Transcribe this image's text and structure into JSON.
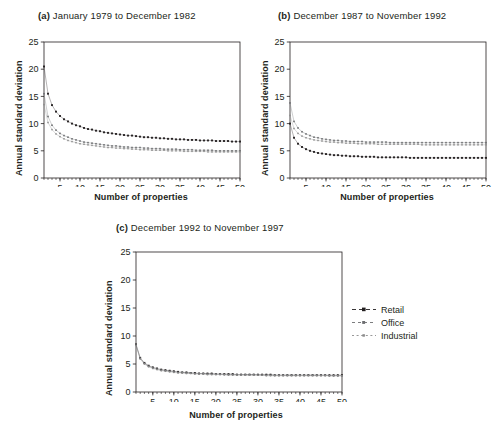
{
  "figure": {
    "y_axis_label": "Annual standard deviation",
    "x_axis_label": "Number of properties",
    "y_ticks": [
      0,
      5,
      10,
      15,
      20,
      25
    ],
    "x_ticks": [
      5,
      10,
      15,
      20,
      25,
      30,
      35,
      40,
      45,
      50
    ],
    "colors": {
      "retail": "#231f20",
      "office": "#6d6e71",
      "industrial": "#8c8c8c",
      "axis": "#231f20"
    }
  },
  "legend": {
    "items": [
      {
        "label": "Retail",
        "key": "retail"
      },
      {
        "label": "Office",
        "key": "office"
      },
      {
        "label": "Industrial",
        "key": "industrial"
      }
    ]
  },
  "panels": [
    {
      "tag": "(a)",
      "title": "January 1979 to December 1982"
    },
    {
      "tag": "(b)",
      "title": "December 1987 to November 1992"
    },
    {
      "tag": "(c)",
      "title": "December 1992 to November 1997"
    }
  ],
  "chart_data": [
    {
      "type": "line",
      "panel": "(a)",
      "title": "(a)  January 1979 to December 1982",
      "xlabel": "Number of properties",
      "ylabel": "Annual standard deviation",
      "xlim": [
        1,
        50
      ],
      "ylim": [
        0,
        25
      ],
      "grid": false,
      "legend_position": "right-outside",
      "x": [
        1,
        2,
        3,
        4,
        5,
        6,
        7,
        8,
        9,
        10,
        11,
        12,
        13,
        14,
        15,
        16,
        17,
        18,
        19,
        20,
        21,
        22,
        23,
        24,
        25,
        26,
        27,
        28,
        29,
        30,
        31,
        32,
        33,
        34,
        35,
        36,
        37,
        38,
        39,
        40,
        41,
        42,
        43,
        44,
        45,
        46,
        47,
        48,
        49,
        50
      ],
      "series": [
        {
          "name": "Retail",
          "values": [
            20.5,
            15.5,
            13.4,
            12.2,
            11.4,
            10.8,
            10.4,
            10.0,
            9.7,
            9.5,
            9.2,
            9.0,
            8.9,
            8.7,
            8.6,
            8.4,
            8.3,
            8.2,
            8.1,
            8.0,
            7.9,
            7.8,
            7.8,
            7.7,
            7.6,
            7.5,
            7.5,
            7.4,
            7.4,
            7.3,
            7.3,
            7.2,
            7.2,
            7.1,
            7.1,
            7.1,
            7.0,
            7.0,
            7.0,
            6.9,
            6.9,
            6.9,
            6.9,
            6.8,
            6.8,
            6.8,
            6.8,
            6.7,
            6.7,
            6.7
          ]
        },
        {
          "name": "Office",
          "values": [
            15.5,
            11.3,
            9.7,
            8.8,
            8.2,
            7.8,
            7.5,
            7.2,
            7.0,
            6.8,
            6.6,
            6.5,
            6.4,
            6.3,
            6.2,
            6.1,
            6.0,
            5.9,
            5.9,
            5.8,
            5.7,
            5.7,
            5.6,
            5.6,
            5.6,
            5.5,
            5.5,
            5.4,
            5.4,
            5.4,
            5.3,
            5.3,
            5.3,
            5.3,
            5.2,
            5.2,
            5.2,
            5.2,
            5.1,
            5.1,
            5.1,
            5.1,
            5.1,
            5.0,
            5.0,
            5.0,
            5.0,
            5.0,
            5.0,
            5.0
          ]
        },
        {
          "name": "Industrial",
          "values": [
            13.5,
            10.2,
            8.9,
            8.1,
            7.6,
            7.2,
            6.9,
            6.7,
            6.5,
            6.3,
            6.2,
            6.1,
            6.0,
            5.9,
            5.8,
            5.7,
            5.6,
            5.6,
            5.5,
            5.5,
            5.4,
            5.4,
            5.3,
            5.3,
            5.2,
            5.2,
            5.2,
            5.1,
            5.1,
            5.1,
            5.1,
            5.0,
            5.0,
            5.0,
            5.0,
            4.9,
            4.9,
            4.9,
            4.9,
            4.9,
            4.9,
            4.8,
            4.8,
            4.8,
            4.8,
            4.8,
            4.8,
            4.8,
            4.8,
            4.8
          ]
        }
      ]
    },
    {
      "type": "line",
      "panel": "(b)",
      "title": "(b)  December 1987 to November 1992",
      "xlabel": "Number of properties",
      "ylabel": "Annual standard deviation",
      "xlim": [
        1,
        50
      ],
      "ylim": [
        0,
        25
      ],
      "grid": false,
      "legend_position": "right-outside",
      "x": [
        1,
        2,
        3,
        4,
        5,
        6,
        7,
        8,
        9,
        10,
        11,
        12,
        13,
        14,
        15,
        16,
        17,
        18,
        19,
        20,
        21,
        22,
        23,
        24,
        25,
        26,
        27,
        28,
        29,
        30,
        31,
        32,
        33,
        34,
        35,
        36,
        37,
        38,
        39,
        40,
        41,
        42,
        43,
        44,
        45,
        46,
        47,
        48,
        49,
        50
      ],
      "series": [
        {
          "name": "Retail",
          "values": [
            10.0,
            7.4,
            6.3,
            5.7,
            5.3,
            5.0,
            4.8,
            4.6,
            4.5,
            4.4,
            4.3,
            4.2,
            4.2,
            4.1,
            4.1,
            4.0,
            4.0,
            4.0,
            3.9,
            3.9,
            3.9,
            3.9,
            3.8,
            3.8,
            3.8,
            3.8,
            3.8,
            3.8,
            3.8,
            3.8,
            3.7,
            3.7,
            3.7,
            3.7,
            3.7,
            3.7,
            3.7,
            3.7,
            3.7,
            3.7,
            3.7,
            3.7,
            3.7,
            3.7,
            3.7,
            3.7,
            3.7,
            3.7,
            3.7,
            3.7
          ]
        },
        {
          "name": "Office",
          "values": [
            13.8,
            10.4,
            9.2,
            8.5,
            8.1,
            7.8,
            7.5,
            7.4,
            7.2,
            7.1,
            7.0,
            6.9,
            6.9,
            6.8,
            6.8,
            6.7,
            6.7,
            6.7,
            6.7,
            6.6,
            6.6,
            6.6,
            6.6,
            6.6,
            6.6,
            6.5,
            6.5,
            6.5,
            6.5,
            6.5,
            6.5,
            6.5,
            6.5,
            6.5,
            6.5,
            6.5,
            6.5,
            6.5,
            6.5,
            6.5,
            6.5,
            6.5,
            6.5,
            6.5,
            6.5,
            6.5,
            6.5,
            6.5,
            6.5,
            6.5
          ]
        },
        {
          "name": "Industrial",
          "values": [
            11.5,
            9.1,
            8.2,
            7.7,
            7.4,
            7.2,
            7.0,
            6.9,
            6.8,
            6.7,
            6.6,
            6.6,
            6.5,
            6.5,
            6.4,
            6.4,
            6.4,
            6.3,
            6.3,
            6.3,
            6.3,
            6.3,
            6.2,
            6.2,
            6.2,
            6.2,
            6.2,
            6.2,
            6.2,
            6.2,
            6.2,
            6.2,
            6.2,
            6.1,
            6.1,
            6.1,
            6.1,
            6.1,
            6.1,
            6.1,
            6.1,
            6.1,
            6.1,
            6.1,
            6.1,
            6.1,
            6.1,
            6.1,
            6.1,
            6.1
          ]
        }
      ]
    },
    {
      "type": "line",
      "panel": "(c)",
      "title": "(c)  December 1992 to November 1997",
      "xlabel": "Number of properties",
      "ylabel": "Annual standard deviation",
      "xlim": [
        1,
        50
      ],
      "ylim": [
        0,
        25
      ],
      "grid": false,
      "legend_position": "right-outside",
      "x": [
        1,
        2,
        3,
        4,
        5,
        6,
        7,
        8,
        9,
        10,
        11,
        12,
        13,
        14,
        15,
        16,
        17,
        18,
        19,
        20,
        21,
        22,
        23,
        24,
        25,
        26,
        27,
        28,
        29,
        30,
        31,
        32,
        33,
        34,
        35,
        36,
        37,
        38,
        39,
        40,
        41,
        42,
        43,
        44,
        45,
        46,
        47,
        48,
        49,
        50
      ],
      "series": [
        {
          "name": "Retail",
          "values": [
            8.5,
            6.1,
            5.2,
            4.7,
            4.4,
            4.2,
            4.0,
            3.9,
            3.8,
            3.7,
            3.6,
            3.5,
            3.5,
            3.4,
            3.4,
            3.3,
            3.3,
            3.3,
            3.3,
            3.2,
            3.2,
            3.2,
            3.2,
            3.2,
            3.1,
            3.1,
            3.1,
            3.1,
            3.1,
            3.1,
            3.1,
            3.1,
            3.1,
            3.0,
            3.0,
            3.0,
            3.0,
            3.0,
            3.0,
            3.0,
            3.0,
            3.0,
            3.0,
            3.0,
            3.0,
            3.0,
            3.0,
            3.0,
            3.0,
            3.0
          ]
        },
        {
          "name": "Office",
          "values": [
            8.4,
            6.0,
            5.1,
            4.6,
            4.3,
            4.1,
            3.9,
            3.8,
            3.7,
            3.6,
            3.5,
            3.5,
            3.4,
            3.4,
            3.3,
            3.3,
            3.3,
            3.2,
            3.2,
            3.2,
            3.2,
            3.1,
            3.1,
            3.1,
            3.1,
            3.1,
            3.1,
            3.1,
            3.1,
            3.0,
            3.0,
            3.0,
            3.0,
            3.0,
            3.0,
            3.0,
            3.0,
            3.0,
            3.0,
            3.0,
            3.0,
            3.0,
            3.0,
            3.0,
            3.0,
            3.0,
            2.9,
            2.9,
            2.9,
            2.9
          ]
        },
        {
          "name": "Industrial",
          "values": [
            8.3,
            5.9,
            5.0,
            4.5,
            4.2,
            4.0,
            3.8,
            3.7,
            3.6,
            3.5,
            3.4,
            3.4,
            3.3,
            3.3,
            3.2,
            3.2,
            3.2,
            3.1,
            3.1,
            3.1,
            3.1,
            3.1,
            3.0,
            3.0,
            3.0,
            3.0,
            3.0,
            3.0,
            3.0,
            3.0,
            3.0,
            2.9,
            2.9,
            2.9,
            2.9,
            2.9,
            2.9,
            2.9,
            2.9,
            2.9,
            2.9,
            2.9,
            2.9,
            2.9,
            2.9,
            2.9,
            2.9,
            2.9,
            2.9,
            2.9
          ]
        }
      ]
    }
  ]
}
